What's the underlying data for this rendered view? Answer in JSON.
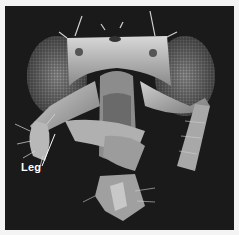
{
  "image": {
    "description": "Scanning electron micrograph of a fly head, frontal view, with legs growing from the head",
    "background_color": "#1a1a1a",
    "border_color": "#f4f4f4"
  },
  "annotations": [
    {
      "text": "Leg",
      "color": "#ffffff"
    }
  ]
}
